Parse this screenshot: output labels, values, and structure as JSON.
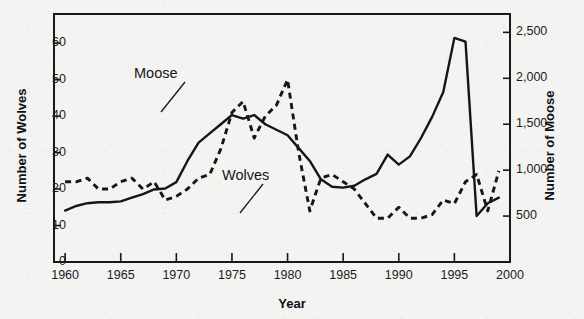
{
  "chart_data": {
    "type": "line",
    "title": "",
    "xlabel": "Year",
    "ylabel": "Number of Wolves",
    "ylabel_right": "Number of Moose",
    "xlim": [
      1959,
      2000
    ],
    "ylim": [
      0,
      68
    ],
    "ylim_right": [
      0,
      2700
    ],
    "grid": false,
    "legend": "inline-annotations",
    "xticks": [
      "1960",
      "1965",
      "1970",
      "1975",
      "1980",
      "1985",
      "1990",
      "1995",
      "2000"
    ],
    "xtick_values": [
      1960,
      1965,
      1970,
      1975,
      1980,
      1985,
      1990,
      1995,
      2000
    ],
    "yticks_left": [
      "0",
      "10",
      "20",
      "30",
      "40",
      "50",
      "60"
    ],
    "ytick_values_left": [
      0,
      10,
      20,
      30,
      40,
      50,
      60
    ],
    "yticks_right": [
      "500",
      "1,000",
      "1,500",
      "2,000",
      "2,500"
    ],
    "ytick_values_right": [
      500,
      1000,
      1500,
      2000,
      2500
    ],
    "annotations": [
      {
        "text": "Moose",
        "x": 1968.0,
        "y_right": 1870
      },
      {
        "text": "Wolves",
        "x": 1974.5,
        "y_left": 40
      }
    ],
    "series": [
      {
        "name": "Moose",
        "axis": "right",
        "style": "solid",
        "color": "#15161a",
        "x": [
          1960,
          1961,
          1962,
          1963,
          1964,
          1965,
          1966,
          1967,
          1968,
          1969,
          1970,
          1971,
          1972,
          1973,
          1974,
          1975,
          1976,
          1977,
          1978,
          1979,
          1980,
          1981,
          1982,
          1983,
          1984,
          1985,
          1986,
          1987,
          1988,
          1989,
          1990,
          1991,
          1992,
          1993,
          1994,
          1995,
          1996,
          1997,
          1998,
          1999
        ],
        "values": [
          560,
          610,
          640,
          650,
          650,
          660,
          700,
          740,
          790,
          800,
          870,
          1100,
          1300,
          1400,
          1500,
          1600,
          1560,
          1600,
          1500,
          1440,
          1380,
          1240,
          1100,
          900,
          820,
          810,
          830,
          900,
          960,
          1170,
          1060,
          1150,
          1350,
          1580,
          1850,
          2440,
          2400,
          500,
          640,
          700
        ],
        "notes": "Peak ~2,440 in 1995 then crash to ~500 in 1997"
      },
      {
        "name": "Wolves",
        "axis": "left",
        "style": "dashed",
        "color": "#15161a",
        "x": [
          1960,
          1961,
          1962,
          1963,
          1964,
          1965,
          1966,
          1967,
          1968,
          1969,
          1970,
          1971,
          1972,
          1973,
          1974,
          1975,
          1976,
          1977,
          1978,
          1979,
          1980,
          1981,
          1982,
          1983,
          1984,
          1985,
          1986,
          1987,
          1988,
          1989,
          1990,
          1991,
          1992,
          1993,
          1994,
          1995,
          1996,
          1997,
          1998,
          1999
        ],
        "values": [
          22,
          22,
          23,
          20,
          20,
          22,
          23,
          20,
          22,
          17,
          18,
          20,
          23,
          24,
          31,
          41,
          44,
          34,
          40,
          43,
          50,
          30,
          14,
          23,
          24,
          22,
          20,
          16,
          12,
          12,
          15,
          12,
          12,
          13,
          17,
          16,
          22,
          24,
          14,
          25
        ],
        "notes": "Peak 50 in 1980, crash to 14 in 1982"
      }
    ]
  }
}
